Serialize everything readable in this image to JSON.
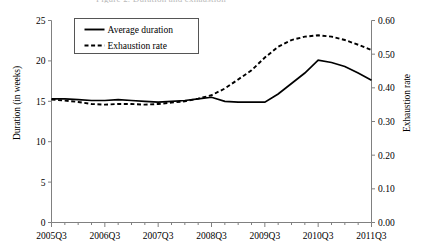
{
  "cut_title": "Figure 2. Duration and exhaustion",
  "chart_data": {
    "type": "line",
    "title": "",
    "xlabel": "",
    "ylabel": "Duration (in weeks)",
    "y2label": "Exhaustion rate",
    "grid": false,
    "legend_position": "top-left",
    "ylim": [
      0,
      25
    ],
    "y2lim": [
      0.0,
      0.6
    ],
    "yticks": [
      "0",
      "5",
      "10",
      "15",
      "20",
      "25"
    ],
    "ytick_values": [
      0,
      5,
      10,
      15,
      20,
      25
    ],
    "y2ticks": [
      "0.00",
      "0.10",
      "0.20",
      "0.30",
      "0.40",
      "0.50",
      "0.60"
    ],
    "y2tick_values": [
      0.0,
      0.1,
      0.2,
      0.3,
      0.4,
      0.5,
      0.6
    ],
    "xticks": [
      "2005Q3",
      "2006Q3",
      "2007Q3",
      "2008Q3",
      "2009Q3",
      "2010Q3",
      "2011Q3"
    ],
    "x": [
      "2005Q3",
      "2005Q4",
      "2006Q1",
      "2006Q2",
      "2006Q3",
      "2006Q4",
      "2007Q1",
      "2007Q2",
      "2007Q3",
      "2007Q4",
      "2008Q1",
      "2008Q2",
      "2008Q3",
      "2008Q4",
      "2009Q1",
      "2009Q2",
      "2009Q3",
      "2009Q4",
      "2010Q1",
      "2010Q2",
      "2010Q3",
      "2010Q4",
      "2011Q1",
      "2011Q2",
      "2011Q3"
    ],
    "series": [
      {
        "name": "Average duration",
        "axis": "left",
        "style": "solid",
        "color": "#000000",
        "values": [
          15.3,
          15.3,
          15.2,
          15.1,
          15.1,
          15.2,
          15.1,
          15.0,
          14.9,
          15.0,
          15.1,
          15.3,
          15.5,
          15.0,
          14.9,
          14.9,
          14.9,
          15.9,
          17.2,
          18.5,
          20.1,
          19.8,
          19.3,
          18.5,
          17.6
        ]
      },
      {
        "name": "Exhaustion rate",
        "axis": "right",
        "style": "dashed",
        "color": "#000000",
        "values": [
          0.365,
          0.362,
          0.358,
          0.352,
          0.35,
          0.352,
          0.352,
          0.35,
          0.352,
          0.356,
          0.36,
          0.368,
          0.378,
          0.398,
          0.425,
          0.452,
          0.49,
          0.522,
          0.542,
          0.552,
          0.556,
          0.552,
          0.542,
          0.528,
          0.512
        ]
      }
    ]
  },
  "legend": {
    "items": [
      {
        "label": "Average duration",
        "style": "solid"
      },
      {
        "label": "Exhaustion rate",
        "style": "dashed"
      }
    ]
  }
}
